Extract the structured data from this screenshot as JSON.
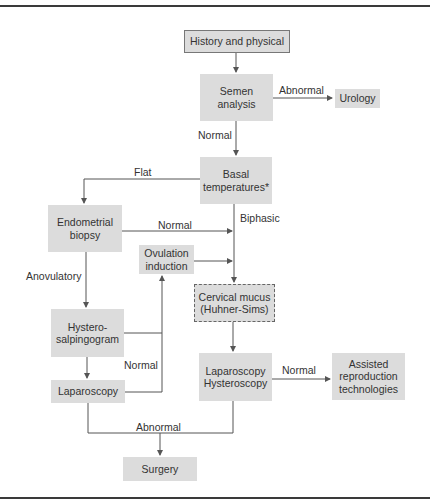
{
  "nodes": {
    "history": "History and physical",
    "semen": "Semen analysis",
    "urology": "Urology",
    "basal": "Basal temperatures*",
    "endometrial": "Endometrial biopsy",
    "ovulation": "Ovulation induction",
    "cervical": "Cervical mucus (Huhner-Sims)",
    "hystero": "Hystero-salpingogram",
    "laparoscopy": "Laparoscopy",
    "lap_hyst": "Laparoscopy Hysteroscopy",
    "assisted": "Assisted reproduction technologies",
    "surgery": "Surgery"
  },
  "node_lines": {
    "semen": [
      "Semen",
      "analysis"
    ],
    "basal": [
      "Basal",
      "temperatures*"
    ],
    "endometrial": [
      "Endometrial",
      "biopsy"
    ],
    "ovulation": [
      "Ovulation",
      "induction"
    ],
    "cervical": [
      "Cervical mucus",
      "(Huhner-Sims)"
    ],
    "hystero": [
      "Hystero-",
      "salpingogram"
    ],
    "lap_hyst": [
      "Laparoscopy",
      "Hysteroscopy"
    ],
    "assisted": [
      "Assisted",
      "reproduction",
      "technologies"
    ]
  },
  "edges": {
    "semen_abnormal": "Abnormal",
    "semen_normal": "Normal",
    "basal_flat": "Flat",
    "basal_biphasic": "Biphasic",
    "endometrial_normal": "Normal",
    "endometrial_anovulatory": "Anovulatory",
    "hsg_normal": "Normal",
    "laphyst_normal": "Normal",
    "abnormal_surgery": "Abnormal"
  },
  "colors": {
    "box_fill": "#dcdcdc",
    "line": "#555555",
    "rule": "#3a3a3a"
  }
}
